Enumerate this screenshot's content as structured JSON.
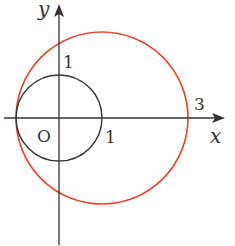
{
  "diagram": {
    "type": "coordinate-plane-circles",
    "axes": {
      "x_label": "x",
      "y_label": "y",
      "origin_label": "O"
    },
    "tick_labels": {
      "y_one": "1",
      "x_one": "1",
      "x_three": "3"
    },
    "circles": [
      {
        "name": "unit-circle",
        "center": [
          0,
          0
        ],
        "radius": 1,
        "color": "#333333"
      },
      {
        "name": "red-circle",
        "center": [
          1,
          0
        ],
        "radius": 2,
        "color": "#e8452c"
      }
    ],
    "colors": {
      "axis": "#333333",
      "black_circle": "#333333",
      "red_circle": "#e8452c"
    }
  }
}
